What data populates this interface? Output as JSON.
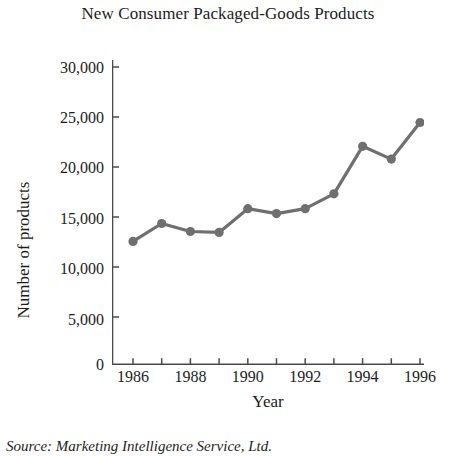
{
  "chart_data": {
    "type": "line",
    "title": "New Consumer Packaged-Goods Products",
    "xlabel": "Year",
    "ylabel": "Number of products",
    "x": [
      1986,
      1987,
      1988,
      1989,
      1990,
      1991,
      1992,
      1993,
      1994,
      1995,
      1996
    ],
    "values": [
      12400,
      14200,
      13400,
      13300,
      15700,
      15200,
      15700,
      17200,
      22000,
      20700,
      24400
    ],
    "series": [
      {
        "name": "Number of products",
        "values": [
          12400,
          14200,
          13400,
          13300,
          15700,
          15200,
          15700,
          17200,
          22000,
          20700,
          24400
        ]
      }
    ],
    "xlim": [
      1986,
      1996
    ],
    "ylim": [
      0,
      30000
    ],
    "x_tick_values": [
      1986,
      1987,
      1988,
      1989,
      1990,
      1991,
      1992,
      1993,
      1994,
      1995,
      1996
    ],
    "x_tick_labels": [
      "1986",
      "",
      "1988",
      "",
      "1990",
      "",
      "1992",
      "",
      "1994",
      "",
      "1996"
    ],
    "y_ticks": [
      0,
      5000,
      10000,
      15000,
      20000,
      25000,
      30000
    ],
    "y_tick_labels": [
      "0",
      "5,000",
      "10,000",
      "15,000",
      "20,000",
      "25,000",
      "30,000"
    ],
    "grid": false,
    "legend": false,
    "marker": "circle",
    "line_color": "#6f6f6f",
    "marker_color": "#6f6f6f",
    "axis_color": "#4a4a4a",
    "source": "Source: Marketing Intelligence Service, Ltd."
  }
}
